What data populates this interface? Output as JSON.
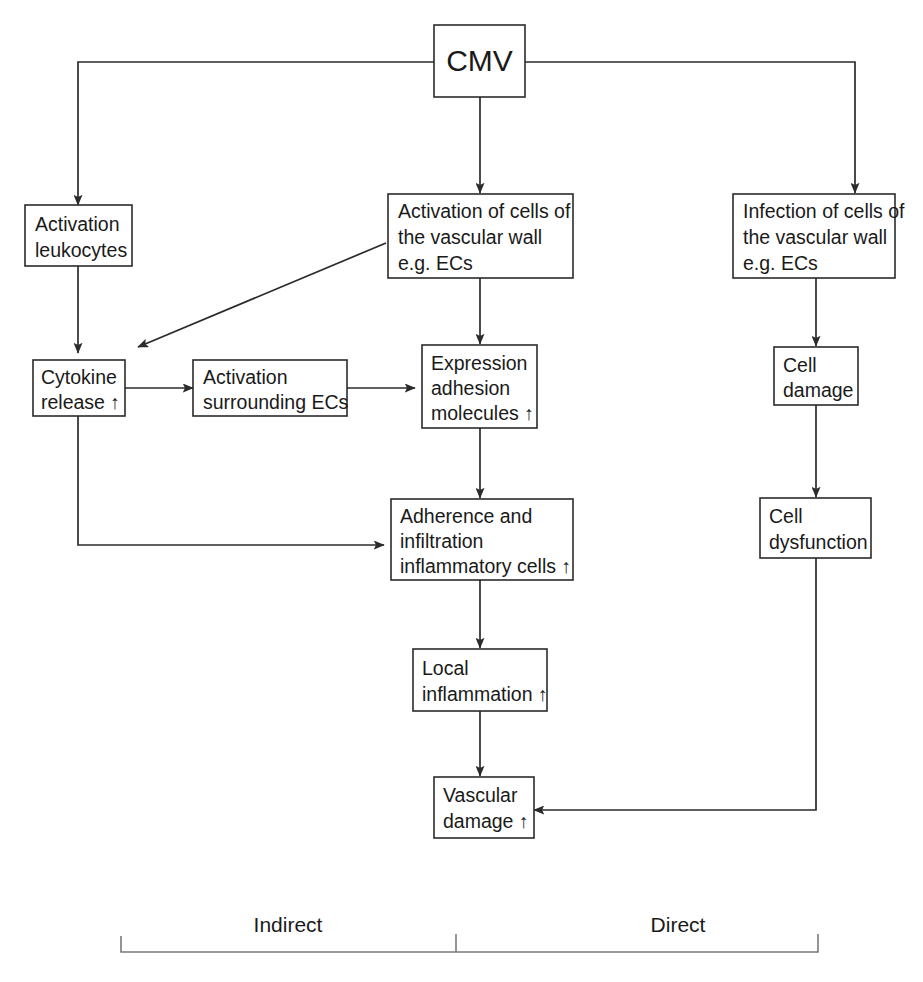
{
  "diagram": {
    "stroke_color": "#2b2b2b",
    "bracket_color": "#7a7a7a",
    "background_color": "#ffffff",
    "nodes": {
      "cmv": {
        "label": "CMV"
      },
      "activation_leukocytes": {
        "line1": "Activation",
        "line2": "leukocytes"
      },
      "activation_vascular": {
        "line1": "Activation of cells of",
        "line2": "the vascular wall",
        "line3": "e.g. ECs"
      },
      "infection_vascular": {
        "line1": "Infection of cells of",
        "line2": "the vascular wall",
        "line3": "e.g. ECs"
      },
      "cytokine_release": {
        "line1": "Cytokine",
        "line2": "release ↑"
      },
      "activation_surrounding": {
        "line1": "Activation",
        "line2": "surrounding ECs"
      },
      "expression_adhesion": {
        "line1": "Expression",
        "line2": "adhesion",
        "line3": "molecules ↑"
      },
      "cell_damage": {
        "line1": "Cell",
        "line2": "damage"
      },
      "adherence_infiltration": {
        "line1": "Adherence and",
        "line2": "infiltration",
        "line3": "inflammatory cells ↑"
      },
      "cell_dysfunction": {
        "line1": "Cell",
        "line2": "dysfunction"
      },
      "local_inflammation": {
        "line1": "Local",
        "line2": "inflammation ↑"
      },
      "vascular_damage": {
        "line1": "Vascular",
        "line2": "damage ↑"
      }
    },
    "axis": {
      "indirect_label": "Indirect",
      "direct_label": "Direct"
    }
  }
}
